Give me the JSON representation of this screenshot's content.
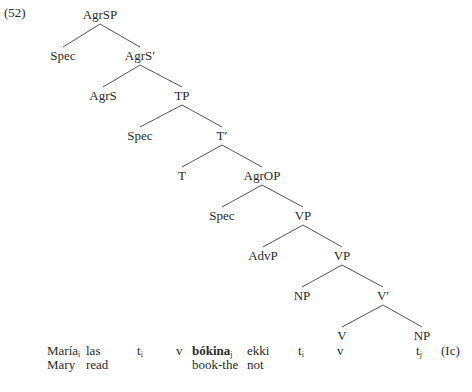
{
  "example_number": "(52)",
  "tree": {
    "nodes": [
      {
        "id": "n0",
        "label": "AgrSP",
        "x": 100,
        "y": 8
      },
      {
        "id": "n1",
        "label": "Spec",
        "x": 63,
        "y": 49
      },
      {
        "id": "n2",
        "label": "AgrS′",
        "x": 140,
        "y": 49
      },
      {
        "id": "n3",
        "label": "AgrS",
        "x": 103,
        "y": 89
      },
      {
        "id": "n4",
        "label": "TP",
        "x": 182,
        "y": 89
      },
      {
        "id": "n5",
        "label": "Spec",
        "x": 140,
        "y": 129
      },
      {
        "id": "n6",
        "label": "T′",
        "x": 222,
        "y": 129
      },
      {
        "id": "n7",
        "label": "T",
        "x": 182,
        "y": 169
      },
      {
        "id": "n8",
        "label": "AgrOP",
        "x": 262,
        "y": 169
      },
      {
        "id": "n9",
        "label": "Spec",
        "x": 222,
        "y": 209
      },
      {
        "id": "n10",
        "label": "VP",
        "x": 303,
        "y": 209
      },
      {
        "id": "n11",
        "label": "AdvP",
        "x": 263,
        "y": 249
      },
      {
        "id": "n12",
        "label": "VP",
        "x": 342,
        "y": 249
      },
      {
        "id": "n13",
        "label": "NP",
        "x": 302,
        "y": 289
      },
      {
        "id": "n14",
        "label": "V′",
        "x": 383,
        "y": 289
      },
      {
        "id": "n15",
        "label": "V",
        "x": 342,
        "y": 329
      },
      {
        "id": "n16",
        "label": "NP",
        "x": 422,
        "y": 329
      }
    ],
    "edges": [
      [
        "n0",
        "n1"
      ],
      [
        "n0",
        "n2"
      ],
      [
        "n2",
        "n3"
      ],
      [
        "n2",
        "n4"
      ],
      [
        "n4",
        "n5"
      ],
      [
        "n4",
        "n6"
      ],
      [
        "n6",
        "n7"
      ],
      [
        "n6",
        "n8"
      ],
      [
        "n8",
        "n9"
      ],
      [
        "n8",
        "n10"
      ],
      [
        "n10",
        "n11"
      ],
      [
        "n10",
        "n12"
      ],
      [
        "n12",
        "n13"
      ],
      [
        "n12",
        "n14"
      ],
      [
        "n14",
        "n15"
      ],
      [
        "n14",
        "n16"
      ]
    ]
  },
  "gloss_line_1": {
    "maria": "María",
    "maria_sub": "i",
    "las": "las",
    "t1": "t",
    "t1_sub": "i",
    "v1": "v",
    "bokina": "bókina",
    "bokina_sub": "j",
    "ekki": "ekki",
    "t2": "t",
    "t2_sub": "i",
    "v2": "v",
    "t3": "t",
    "t3_sub": "j",
    "label": "(Ic)"
  },
  "gloss_line_2": {
    "mary": "Mary",
    "read": "read",
    "book_the": "book-the",
    "not": "not"
  }
}
